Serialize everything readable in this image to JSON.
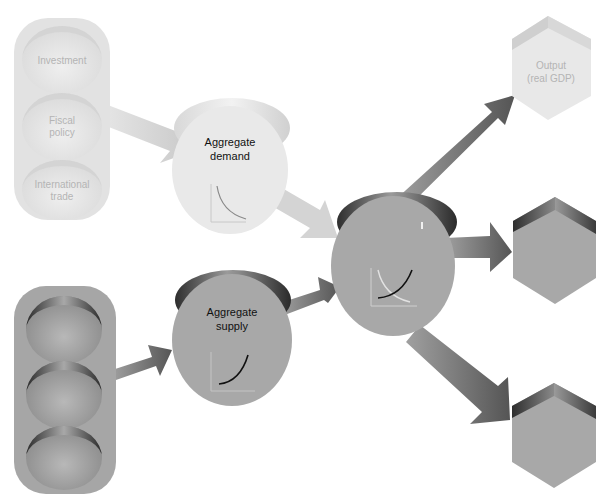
{
  "diagram": {
    "demand_factors": {
      "items": [
        {
          "label_lines": [
            "Investment"
          ]
        },
        {
          "label_lines": [
            "Fiscal",
            "policy"
          ]
        },
        {
          "label_lines": [
            "International",
            "trade"
          ]
        }
      ]
    },
    "supply_factors": {
      "items": [
        {
          "label_lines": []
        },
        {
          "label_lines": []
        },
        {
          "label_lines": []
        }
      ]
    },
    "aggregate_demand": {
      "label_lines": [
        "Aggregate",
        "demand"
      ],
      "curve": "downward-sloping"
    },
    "aggregate_supply": {
      "label_lines": [
        "Aggregate",
        "supply"
      ],
      "curve": "upward-sloping"
    },
    "equilibrium": {
      "label_lines": [],
      "curve": "intersection of demand and supply"
    },
    "outcomes": [
      {
        "label_lines": [
          "Output",
          "(real GDP)"
        ]
      },
      {
        "label_lines": []
      },
      {
        "label_lines": []
      }
    ],
    "colors": {
      "light_fill": "#e6e6e6",
      "light_text": "#b4b4b4",
      "dark_fill": "#a8a8a8",
      "dark_edge": "#3a3a3a",
      "arrow_light": "#d2d2d2",
      "arrow_dark": "#6e6e6e",
      "text": "#111111"
    }
  }
}
